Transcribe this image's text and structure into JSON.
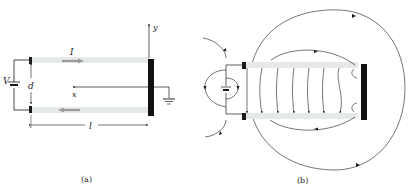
{
  "figure_a": {
    "caption": "(a)",
    "labels": {
      "current": "I",
      "voltage": "V",
      "separation": "d",
      "x_axis": "x",
      "y_axis": "y",
      "length": "l"
    }
  },
  "figure_b": {
    "caption": "(b)"
  },
  "colors": {
    "ink": "#1a1a1a",
    "strip": "#e4e8e4",
    "arrow_gray": "#9a9a9a"
  }
}
